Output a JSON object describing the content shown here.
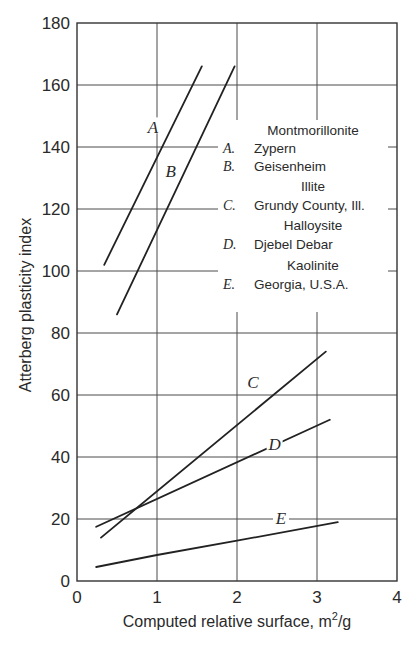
{
  "chart_data": {
    "type": "line",
    "title": "",
    "xlabel": "Computed relative surface, m",
    "xlabel_sup": "2",
    "xlabel_unit": "/g",
    "ylabel": "Atterberg plasticity index",
    "xlim": [
      0,
      4
    ],
    "ylim": [
      0,
      180
    ],
    "xticks": [
      0,
      1,
      2,
      3,
      4
    ],
    "yticks": [
      0,
      20,
      40,
      60,
      80,
      100,
      120,
      140,
      160,
      180
    ],
    "grid": true,
    "legend_position": "upper-right (inside plot)",
    "series": [
      {
        "key": "A",
        "name": "Zypern",
        "group": "Montmorillonite",
        "x": [
          0.34,
          1.56
        ],
        "y": [
          102,
          166
        ]
      },
      {
        "key": "B",
        "name": "Geisenheim",
        "group": "Montmorillonite",
        "x": [
          0.5,
          1.97
        ],
        "y": [
          86,
          166
        ]
      },
      {
        "key": "C",
        "name": "Grundy County, Ill.",
        "group": "Illite",
        "x": [
          0.3,
          3.11
        ],
        "y": [
          14,
          74
        ]
      },
      {
        "key": "D",
        "name": "Djebel Debar",
        "group": "Halloysite",
        "x": [
          0.24,
          3.16
        ],
        "y": [
          17.5,
          52
        ]
      },
      {
        "key": "E",
        "name": "Georgia, U.S.A.",
        "group": "Kaolinite",
        "x": [
          0.24,
          1.0,
          2.0,
          3.26
        ],
        "y": [
          4.5,
          8.4,
          13,
          19
        ]
      }
    ],
    "curve_labels": [
      {
        "text": "A",
        "x": 0.95,
        "y": 146
      },
      {
        "text": "B",
        "x": 1.17,
        "y": 132
      },
      {
        "text": "C",
        "x": 2.2,
        "y": 64
      },
      {
        "text": "D",
        "x": 2.47,
        "y": 44
      },
      {
        "text": "E",
        "x": 2.55,
        "y": 20
      }
    ],
    "legend": [
      {
        "type": "group",
        "text": "Montmorillonite"
      },
      {
        "type": "entry",
        "key": "A.",
        "text": "Zypern"
      },
      {
        "type": "entry",
        "key": "B.",
        "text": "Geisenheim"
      },
      {
        "type": "group",
        "text": "Illite"
      },
      {
        "type": "entry",
        "key": "C.",
        "text": "Grundy County, Ill."
      },
      {
        "type": "group",
        "text": "Halloysite"
      },
      {
        "type": "entry",
        "key": "D.",
        "text": "Djebel Debar"
      },
      {
        "type": "group",
        "text": "Kaolinite"
      },
      {
        "type": "entry",
        "key": "E.",
        "text": "Georgia, U.S.A."
      }
    ]
  }
}
